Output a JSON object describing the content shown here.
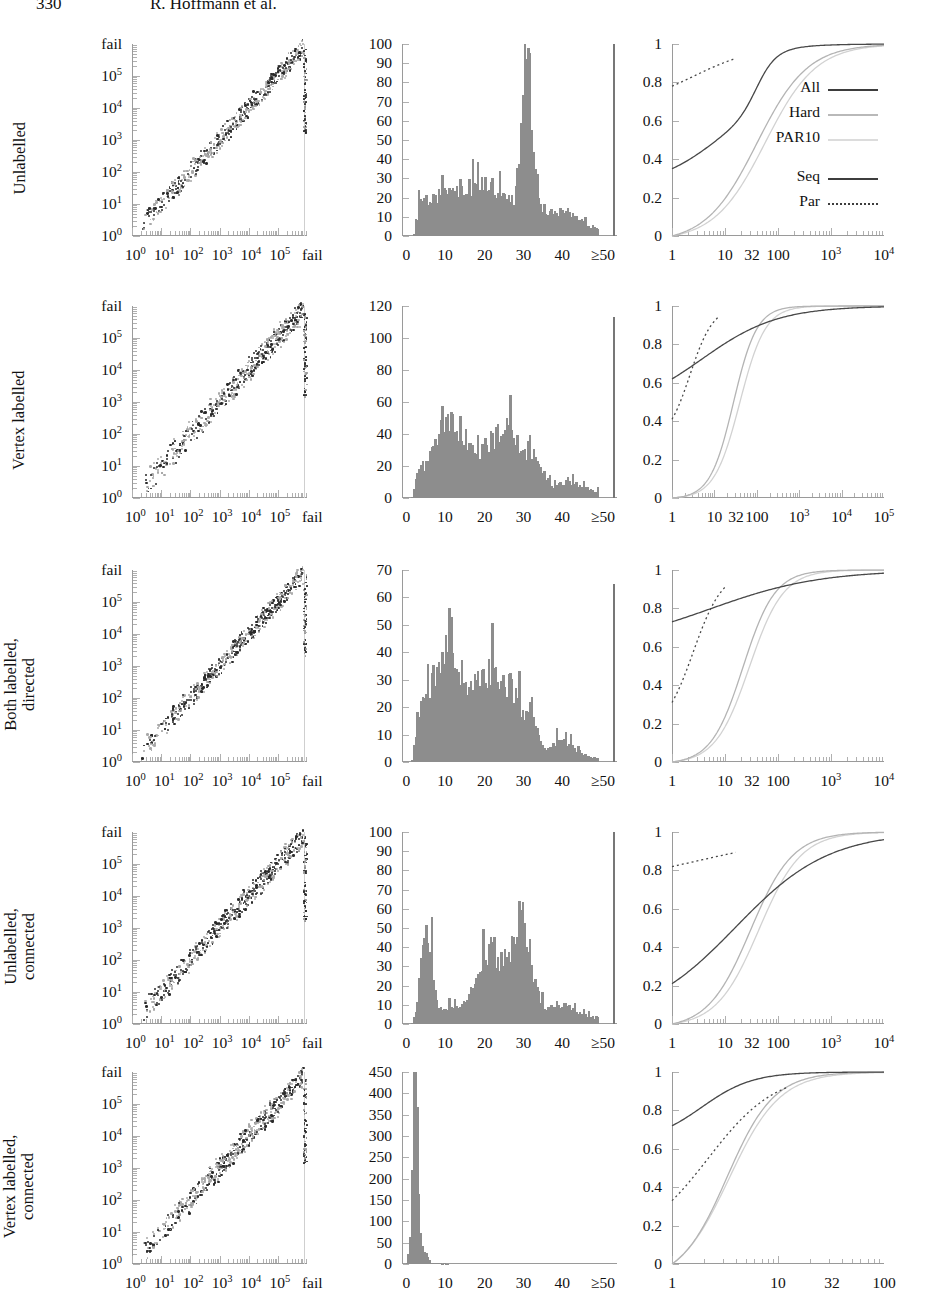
{
  "runhead": {
    "page_number": "330",
    "authors": "R. Hoffmann et al."
  },
  "legend": {
    "entries": [
      {
        "label": "All",
        "style": "solid-dark"
      },
      {
        "label": "Hard",
        "style": "solid-gray"
      },
      {
        "label": "PAR10",
        "style": "solid-light"
      }
    ],
    "line_styles": [
      {
        "label": "Seq",
        "style": "solid"
      },
      {
        "label": "Par",
        "style": "dotted"
      }
    ]
  },
  "rows": [
    {
      "label": "Unlabelled",
      "scatter": {
        "xlabels": [
          "10⁰",
          "10¹",
          "10²",
          "10³",
          "10⁴",
          "10⁵",
          "fail"
        ],
        "ylabels": [
          "fail",
          "10⁵",
          "10⁴",
          "10³",
          "10²",
          "10¹",
          "10⁰"
        ],
        "xlabel_html": [
          "10<sup>0</sup>",
          "10<sup>1</sup>",
          "10<sup>2</sup>",
          "10<sup>3</sup>",
          "10<sup>4</sup>",
          "10<sup>5</sup>",
          "fail"
        ]
      },
      "histogram": {
        "ymax": 100,
        "ystep": 10,
        "yticks": [
          100,
          90,
          80,
          70,
          60,
          50,
          40,
          30,
          20,
          10,
          0
        ],
        "xticks": [
          "0",
          "10",
          "20",
          "30",
          "40",
          "≥50"
        ],
        "peak_value": 97,
        "peak_x": 32,
        "spike_value": 100
      },
      "cdf": {
        "yticks": [
          "1",
          "0.8",
          "0.6",
          "0.4",
          "0.2",
          "0"
        ],
        "xticks": [
          "1",
          "10",
          "32",
          "100",
          "10³",
          "10⁴"
        ],
        "xticks_html": [
          "1",
          "10",
          "32",
          "100",
          "10<sup>3</sup>",
          "10<sup>4</sup>"
        ],
        "xtick_pos": [
          0.0,
          0.25,
          0.3775,
          0.5,
          0.75,
          1.0
        ],
        "all_start": 0.27,
        "par_start": 0.78,
        "has_legend": true
      }
    },
    {
      "label": "Vertex labelled",
      "scatter": {
        "xlabel_html": [
          "10<sup>0</sup>",
          "10<sup>1</sup>",
          "10<sup>2</sup>",
          "10<sup>3</sup>",
          "10<sup>4</sup>",
          "10<sup>5</sup>",
          "fail"
        ],
        "ylabels": [
          "fail",
          "10⁵",
          "10⁴",
          "10³",
          "10²",
          "10¹",
          "10⁰"
        ]
      },
      "histogram": {
        "ymax": 120,
        "ystep": 20,
        "yticks": [
          120,
          100,
          80,
          60,
          40,
          20,
          0
        ],
        "xticks": [
          "0",
          "10",
          "20",
          "30",
          "40",
          "≥50"
        ],
        "peak_value": 68,
        "peak_x": 12,
        "spike_value": 113
      },
      "cdf": {
        "yticks": [
          "1",
          "0.8",
          "0.6",
          "0.4",
          "0.2",
          "0"
        ],
        "xticks_html": [
          "1",
          "10",
          "32",
          "100",
          "10<sup>3</sup>",
          "10<sup>4</sup>",
          "10<sup>5</sup>"
        ],
        "xtick_pos": [
          0.0,
          0.2,
          0.302,
          0.4,
          0.6,
          0.8,
          1.0
        ],
        "all_start": 0.62,
        "par_start": 0.41,
        "has_legend": false
      }
    },
    {
      "label": "Both labelled,\ndirected",
      "scatter": {
        "xlabel_html": [
          "10<sup>0</sup>",
          "10<sup>1</sup>",
          "10<sup>2</sup>",
          "10<sup>3</sup>",
          "10<sup>4</sup>",
          "10<sup>5</sup>",
          "fail"
        ],
        "ylabels": [
          "fail",
          "10⁵",
          "10⁴",
          "10³",
          "10²",
          "10¹",
          "10⁰"
        ]
      },
      "histogram": {
        "ymax": 70,
        "ystep": 10,
        "yticks": [
          70,
          60,
          50,
          40,
          30,
          20,
          10,
          0
        ],
        "xticks": [
          "0",
          "10",
          "20",
          "30",
          "40",
          "≥50"
        ],
        "peak_value": 52,
        "peak_x": 11,
        "spike_value": 65
      },
      "cdf": {
        "yticks": [
          "1",
          "0.8",
          "0.6",
          "0.4",
          "0.2",
          "0"
        ],
        "xticks_html": [
          "1",
          "10",
          "32",
          "100",
          "10<sup>3</sup>",
          "10<sup>4</sup>"
        ],
        "xtick_pos": [
          0.0,
          0.25,
          0.3775,
          0.5,
          0.75,
          1.0
        ],
        "all_start": 0.73,
        "par_start": 0.31,
        "has_legend": false
      }
    },
    {
      "label": "Unlabelled,\nconnected",
      "scatter": {
        "xlabel_html": [
          "10<sup>0</sup>",
          "10<sup>1</sup>",
          "10<sup>2</sup>",
          "10<sup>3</sup>",
          "10<sup>4</sup>",
          "10<sup>5</sup>",
          "fail"
        ],
        "ylabels": [
          "fail",
          "10⁵",
          "10⁴",
          "10³",
          "10²",
          "10¹",
          "10⁰"
        ]
      },
      "histogram": {
        "ymax": 100,
        "ystep": 10,
        "yticks": [
          100,
          90,
          80,
          70,
          60,
          50,
          40,
          30,
          20,
          10,
          0
        ],
        "xticks": [
          "0",
          "10",
          "20",
          "30",
          "40",
          "≥50"
        ],
        "peak_value": 62,
        "peak_x": 30,
        "secondary_peak_value": 49,
        "secondary_peak_x": 6,
        "spike_value": 100
      },
      "cdf": {
        "yticks": [
          "1",
          "0.8",
          "0.6",
          "0.4",
          "0.2",
          "0"
        ],
        "xticks_html": [
          "1",
          "10",
          "32",
          "100",
          "10<sup>3</sup>",
          "10<sup>4</sup>"
        ],
        "xtick_pos": [
          0.0,
          0.25,
          0.3775,
          0.5,
          0.75,
          1.0
        ],
        "all_start": 0.21,
        "par_start": 0.82,
        "has_legend": false
      }
    },
    {
      "label": "Vertex labelled,\nconnected",
      "scatter": {
        "xlabel_html": [
          "10<sup>0</sup>",
          "10<sup>1</sup>",
          "10<sup>2</sup>",
          "10<sup>3</sup>",
          "10<sup>4</sup>",
          "10<sup>5</sup>",
          "fail"
        ],
        "ylabels": [
          "fail",
          "10⁵",
          "10⁴",
          "10³",
          "10²",
          "10¹",
          "10⁰"
        ]
      },
      "histogram": {
        "ymax": 450,
        "ystep": 50,
        "yticks": [
          450,
          400,
          350,
          300,
          250,
          200,
          150,
          100,
          50,
          0
        ],
        "xticks": [
          "0",
          "10",
          "20",
          "30",
          "40",
          "≥50"
        ],
        "peak_value": 430,
        "peak_x": 3,
        "spike_value": 0
      },
      "cdf": {
        "yticks": [
          "1",
          "0.8",
          "0.6",
          "0.4",
          "0.2",
          "0"
        ],
        "xticks_html": [
          "1",
          "10",
          "32",
          "100"
        ],
        "xtick_pos": [
          0.0,
          0.5,
          0.755,
          1.0
        ],
        "all_start": 0.72,
        "par_start": 0.33,
        "has_legend": false
      }
    }
  ],
  "chart_data": {
    "type": "scatter",
    "title": "",
    "panel_grid": "5 rows × 3 columns",
    "columns": [
      {
        "name": "scatter",
        "type": "scatter",
        "xlabel": "fail",
        "ylabel": "fail",
        "xlim_log": [
          0,
          5
        ],
        "ylim_log": [
          0,
          5
        ],
        "note": "log-log, points along diagonal, dark and light gray series"
      },
      {
        "name": "histogram",
        "type": "bar",
        "xlabel": "",
        "ylabel": "",
        "xlim": [
          0,
          50
        ],
        "note": "bin counts, final bin labelled ≥50"
      },
      {
        "name": "cdf",
        "type": "line",
        "xlabel": "",
        "ylabel": "",
        "ylim": [
          0,
          1
        ],
        "note": "cumulative distributions; series All / Hard / PAR10 × Seq(solid) / Par(dotted)"
      }
    ],
    "series_names": [
      "All",
      "Hard",
      "PAR10"
    ],
    "line_styles": [
      "Seq (solid)",
      "Par (dotted)"
    ],
    "row_categories": [
      "Unlabelled",
      "Vertex labelled",
      "Both labelled, directed",
      "Unlabelled, connected",
      "Vertex labelled, connected"
    ]
  }
}
